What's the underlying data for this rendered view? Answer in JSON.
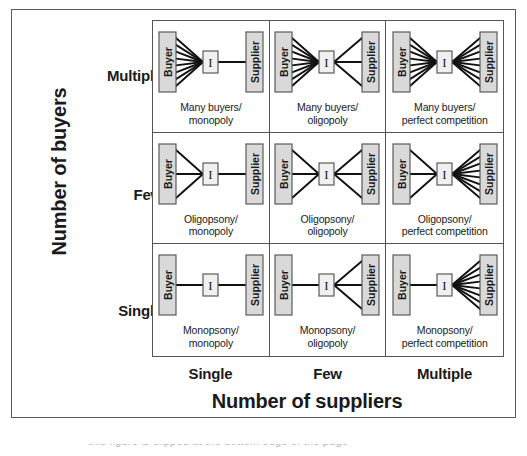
{
  "figure": {
    "y_axis_title": "Number of buyers",
    "x_axis_title": "Number of suppliers",
    "y_ticks": [
      "Multiple",
      "Few",
      "Single"
    ],
    "x_ticks": [
      "Single",
      "Few",
      "Multiple"
    ],
    "node_labels": {
      "buyer": "Buyer",
      "intermediary": "I",
      "supplier": "Supplier"
    },
    "footer_clipped_text": "this figure is clipped at the bottom edge of the page"
  },
  "colors": {
    "frame_border": "#5a5a5a",
    "grid_line": "#555555",
    "node_fill": "#d9d9d9",
    "node_border": "#5a5a5a",
    "intermediary_fill": "#f0f0f0",
    "connector": "#111111",
    "text": "#1a1a1a"
  },
  "chart_data": {
    "type": "table",
    "xlabel": "Number of suppliers",
    "ylabel": "Number of buyers",
    "columns": [
      "Single",
      "Few",
      "Multiple"
    ],
    "rows": [
      "Multiple",
      "Few",
      "Single"
    ],
    "cells": [
      {
        "row": "Multiple",
        "col": "Single",
        "caption": "Many buyers/\nmonopoly",
        "buyer_links": 8,
        "supplier_links": 1
      },
      {
        "row": "Multiple",
        "col": "Few",
        "caption": "Many buyers/\noligopoly",
        "buyer_links": 8,
        "supplier_links": 3
      },
      {
        "row": "Multiple",
        "col": "Multiple",
        "caption": "Many buyers/\nperfect competition",
        "buyer_links": 8,
        "supplier_links": 8
      },
      {
        "row": "Few",
        "col": "Single",
        "caption": "Oligopsony/\nmonopoly",
        "buyer_links": 3,
        "supplier_links": 1
      },
      {
        "row": "Few",
        "col": "Few",
        "caption": "Oligopsony/\noligopoly",
        "buyer_links": 3,
        "supplier_links": 3
      },
      {
        "row": "Few",
        "col": "Multiple",
        "caption": "Oligopsony/\nperfect competition",
        "buyer_links": 3,
        "supplier_links": 8
      },
      {
        "row": "Single",
        "col": "Single",
        "caption": "Monopsony/\nmonopoly",
        "buyer_links": 1,
        "supplier_links": 1
      },
      {
        "row": "Single",
        "col": "Few",
        "caption": "Monopsony/\noligopoly",
        "buyer_links": 1,
        "supplier_links": 3
      },
      {
        "row": "Single",
        "col": "Multiple",
        "caption": "Monopsony/\nperfect competition",
        "buyer_links": 1,
        "supplier_links": 8
      }
    ]
  }
}
